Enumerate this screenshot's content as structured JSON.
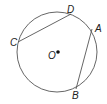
{
  "diagram": {
    "type": "circle-with-chords",
    "circle": {
      "center_label": "O",
      "cx": 57,
      "cy": 52,
      "r": 40
    },
    "points": {
      "A": {
        "label": "A",
        "x": 92,
        "y": 29
      },
      "B": {
        "label": "B",
        "x": 76,
        "y": 89
      },
      "C": {
        "label": "C",
        "x": 18,
        "y": 42
      },
      "D": {
        "label": "D",
        "x": 71,
        "y": 14
      }
    },
    "chords": [
      {
        "from": "C",
        "to": "D"
      },
      {
        "from": "A",
        "to": "B"
      }
    ],
    "colors": {
      "stroke": "#444444",
      "text": "#222222",
      "background": "#ffffff"
    }
  }
}
